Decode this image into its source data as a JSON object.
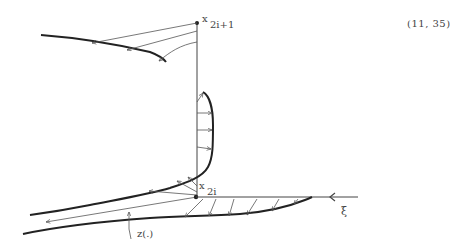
{
  "equation_number": "(11, 35)",
  "labels": {
    "top_point_base": "x",
    "top_point_sub": "2i+1",
    "bottom_point_base": "x",
    "bottom_point_sub": "2i",
    "axis": "ξ",
    "curve": "z(.)"
  },
  "colors": {
    "ink": "#333333",
    "thin_ink": "#555555",
    "background": "#ffffff"
  }
}
